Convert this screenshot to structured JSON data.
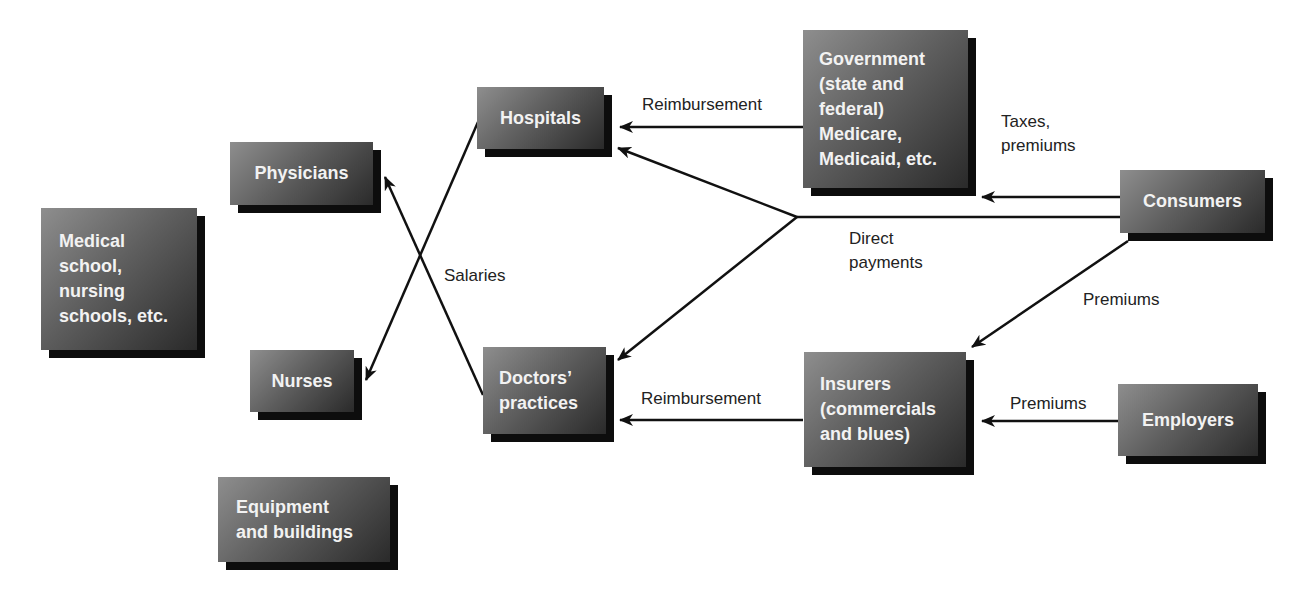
{
  "diagram": {
    "type": "flow",
    "nodes": [
      {
        "id": "medical_schools",
        "label": "Medical\nschool,\nnursing\nschools, etc."
      },
      {
        "id": "physicians",
        "label": "Physicians"
      },
      {
        "id": "nurses",
        "label": "Nurses"
      },
      {
        "id": "equipment",
        "label": "Equipment\nand buildings"
      },
      {
        "id": "hospitals",
        "label": "Hospitals"
      },
      {
        "id": "doctors_practices",
        "label": "Doctors’\npractices"
      },
      {
        "id": "government",
        "label": "Government\n(state and\nfederal)\nMedicare,\nMedicaid, etc."
      },
      {
        "id": "consumers",
        "label": "Consumers"
      },
      {
        "id": "insurers",
        "label": "Insurers\n(commercials\nand blues)"
      },
      {
        "id": "employers",
        "label": "Employers"
      }
    ],
    "edge_labels": {
      "reimbursement_gov": "Reimbursement",
      "taxes_premiums": "Taxes,\npremiums",
      "direct_payments": "Direct\npayments",
      "salaries": "Salaries",
      "premiums_consumers": "Premiums",
      "reimbursement_ins": "Reimbursement",
      "premiums_employers": "Premiums"
    },
    "edges": [
      {
        "from": "government",
        "to": "hospitals",
        "label": "Reimbursement"
      },
      {
        "from": "consumers",
        "to": "government",
        "label": "Taxes, premiums"
      },
      {
        "from": "consumers",
        "to": "hospitals",
        "label": "Direct payments"
      },
      {
        "from": "consumers",
        "to": "doctors_practices",
        "label": "Direct payments"
      },
      {
        "from": "consumers",
        "to": "insurers",
        "label": "Premiums"
      },
      {
        "from": "insurers",
        "to": "doctors_practices",
        "label": "Reimbursement"
      },
      {
        "from": "employers",
        "to": "insurers",
        "label": "Premiums"
      },
      {
        "from": "hospitals",
        "to": "nurses",
        "label": "Salaries"
      },
      {
        "from": "doctors_practices",
        "to": "physicians",
        "label": "Salaries"
      }
    ],
    "colors": {
      "box_light": "#8e8e8e",
      "box_dark": "#2a2a2a",
      "shadow": "#0d0d0d",
      "box_text": "#f2f2f2",
      "line": "#111111",
      "label_text": "#222222"
    }
  }
}
